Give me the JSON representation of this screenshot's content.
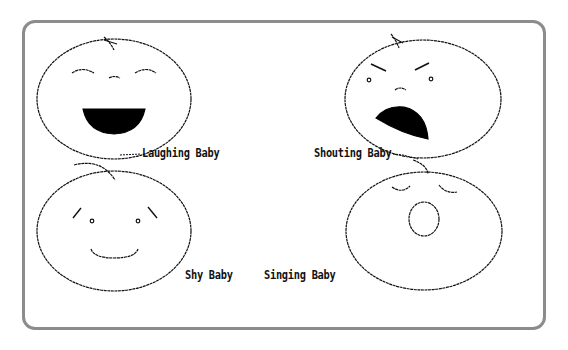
{
  "canvas": {
    "frame_color": "#8c8c8c",
    "ink_color": "#111111",
    "background": "#ffffff"
  },
  "babies": [
    {
      "id": "laughing",
      "label": "Laughing Baby",
      "expression": "laughing",
      "mouth": "filled-semicircle",
      "eyes": "closed-arcs"
    },
    {
      "id": "shouting",
      "label": "Shouting Baby",
      "expression": "shouting",
      "mouth": "filled-open-tilted",
      "eyes": "dots-with-angry-brows"
    },
    {
      "id": "shy",
      "label": "Shy Baby",
      "expression": "shy",
      "mouth": "smile-arc",
      "eyes": "dots-with-slanted-brows"
    },
    {
      "id": "singing",
      "label": "Singing Baby",
      "expression": "singing",
      "mouth": "open-circle",
      "eyes": "closed-arcs"
    }
  ]
}
